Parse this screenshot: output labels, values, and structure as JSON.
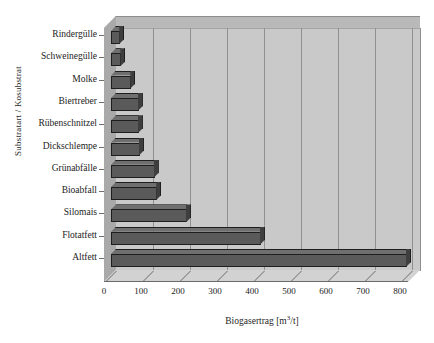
{
  "chart_data": {
    "type": "bar",
    "orientation": "horizontal",
    "title": "",
    "xlabel": "Biogasertrag [m³/t]",
    "ylabel": "Substratart / Kosubstrat",
    "xlabel_text": "Biogasertrag [m",
    "xlabel_sup": "3",
    "xlabel_tail": "/t]",
    "categories": [
      "Rindergülle",
      "Schweinegülle",
      "Molke",
      "Biertreber",
      "Rübenschnitzel",
      "Dickschlempe",
      "Grünabfälle",
      "Bioabfall",
      "Silomais",
      "Flotatfett",
      "Altfett"
    ],
    "values": [
      25,
      28,
      55,
      75,
      75,
      78,
      118,
      125,
      205,
      405,
      800
    ],
    "xlim": [
      0,
      800
    ],
    "xticks": [
      0,
      100,
      200,
      300,
      400,
      500,
      600,
      700,
      800
    ],
    "xticklabels": [
      "0",
      "100",
      "200",
      "300",
      "400",
      "500",
      "600",
      "700",
      "800"
    ],
    "grid": true,
    "legend": null,
    "style": "3d-bar",
    "colors": {
      "bar_face": "#5a5a5a",
      "bar_top": "#6f6f6f",
      "bar_side": "#3e3e3e",
      "bar_outline": "#1e1e1e",
      "plot_background": "#c9c9c9",
      "gridline": "#909090",
      "floor": "#d2d2d2",
      "page_background": "#ffffff",
      "text": "#1c1c1c"
    }
  }
}
